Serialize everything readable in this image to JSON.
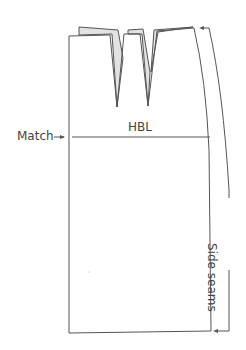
{
  "diagram": {
    "type": "skirt-pattern",
    "labels": {
      "match": "Match",
      "hbl": "HBL",
      "side_seams": "Side seams"
    },
    "colors": {
      "line": "#555555",
      "fold_fill": "#e2e2e2",
      "text": "#444444"
    },
    "elements": [
      {
        "name": "pattern-outline",
        "desc": "skirt block with waistline, two darts, curved side seam, hem"
      },
      {
        "name": "folded-waist",
        "desc": "shaded raised waist section showing dart fold"
      },
      {
        "name": "dart-1",
        "tip": [
          117,
          107
        ]
      },
      {
        "name": "dart-2",
        "tip": [
          148,
          106
        ]
      },
      {
        "name": "hip-line",
        "desc": "horizontal HBL line"
      },
      {
        "name": "match-arrow",
        "desc": "arrow pointing to hip line at centre"
      },
      {
        "name": "side-seam-bracket",
        "desc": "curved bracket with arrows spanning side seams"
      }
    ]
  }
}
